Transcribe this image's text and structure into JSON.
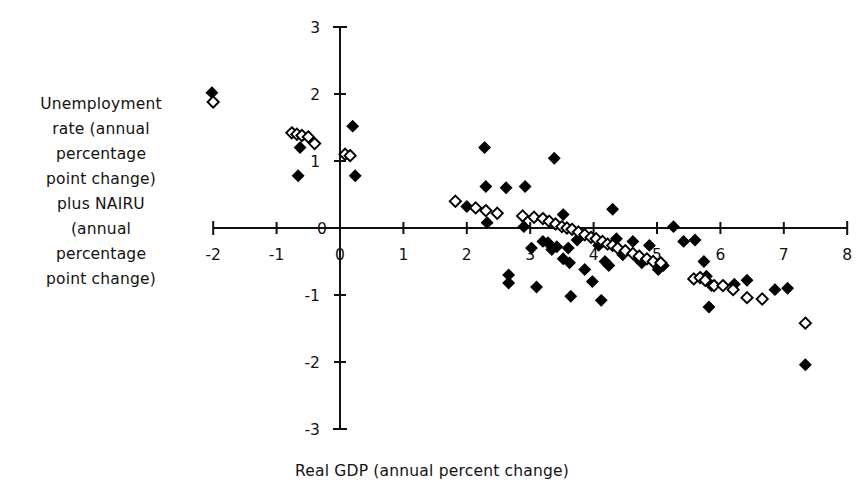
{
  "chart_data": {
    "type": "scatter",
    "title": "",
    "xlabel": "Real GDP (annual percent change)",
    "ylabel": "Unemployment\nrate (annual\npercentage\npoint change)\nplus NAIRU\n(annual\npercentage\npoint change)",
    "xlim": [
      -2,
      8
    ],
    "ylim": [
      -3,
      3
    ],
    "xticks": [
      -2,
      -1,
      0,
      1,
      2,
      3,
      4,
      5,
      6,
      7,
      8
    ],
    "xtick_labels": [
      "-2",
      "-1",
      "0",
      "1",
      "2",
      "3",
      "4",
      "5",
      "6",
      "7",
      "8"
    ],
    "yticks": [
      -3,
      -2,
      -1,
      0,
      1,
      2,
      3
    ],
    "ytick_labels": [
      "-3",
      "-2",
      "-1",
      "0",
      "1",
      "2",
      "3"
    ],
    "grid": false,
    "legend": "none",
    "axis_style": "crossed-spines-at-origin",
    "series": [
      {
        "name": "filled",
        "marker": "filled-diamond",
        "color": "#000000",
        "points": [
          [
            -2.02,
            2.02
          ],
          [
            -0.63,
            1.2
          ],
          [
            -0.66,
            0.78
          ],
          [
            0.2,
            1.52
          ],
          [
            0.24,
            0.78
          ],
          [
            2.28,
            1.2
          ],
          [
            2.3,
            0.62
          ],
          [
            2.32,
            0.08
          ],
          [
            2.62,
            0.6
          ],
          [
            2.0,
            0.32
          ],
          [
            2.66,
            -0.7
          ],
          [
            2.66,
            -0.82
          ],
          [
            2.92,
            0.62
          ],
          [
            2.9,
            0.02
          ],
          [
            3.02,
            -0.3
          ],
          [
            3.2,
            -0.2
          ],
          [
            3.28,
            -0.22
          ],
          [
            3.34,
            -0.32
          ],
          [
            3.42,
            -0.28
          ],
          [
            3.1,
            -0.88
          ],
          [
            3.52,
            -0.46
          ],
          [
            3.6,
            -0.3
          ],
          [
            3.62,
            -0.52
          ],
          [
            3.38,
            1.04
          ],
          [
            3.52,
            0.2
          ],
          [
            3.74,
            -0.18
          ],
          [
            3.86,
            -0.62
          ],
          [
            3.64,
            -1.02
          ],
          [
            3.98,
            -0.8
          ],
          [
            4.08,
            -0.26
          ],
          [
            4.18,
            -0.5
          ],
          [
            4.24,
            -0.56
          ],
          [
            4.3,
            0.28
          ],
          [
            4.36,
            -0.16
          ],
          [
            4.46,
            -0.4
          ],
          [
            4.12,
            -1.08
          ],
          [
            4.62,
            -0.2
          ],
          [
            4.7,
            -0.46
          ],
          [
            4.76,
            -0.52
          ],
          [
            4.88,
            -0.26
          ],
          [
            5.02,
            -0.62
          ],
          [
            5.1,
            -0.56
          ],
          [
            5.26,
            0.02
          ],
          [
            5.42,
            -0.2
          ],
          [
            5.6,
            -0.18
          ],
          [
            5.74,
            -0.5
          ],
          [
            5.78,
            -0.72
          ],
          [
            5.86,
            -0.86
          ],
          [
            5.82,
            -1.18
          ],
          [
            6.22,
            -0.84
          ],
          [
            6.42,
            -0.78
          ],
          [
            6.86,
            -0.92
          ],
          [
            7.06,
            -0.9
          ],
          [
            7.34,
            -2.04
          ]
        ]
      },
      {
        "name": "open",
        "marker": "open-diamond",
        "color": "#000000",
        "points": [
          [
            -2.0,
            1.88
          ],
          [
            -0.76,
            1.42
          ],
          [
            -0.68,
            1.4
          ],
          [
            -0.6,
            1.38
          ],
          [
            -0.5,
            1.36
          ],
          [
            -0.4,
            1.26
          ],
          [
            0.08,
            1.1
          ],
          [
            0.16,
            1.08
          ],
          [
            1.82,
            0.4
          ],
          [
            2.14,
            0.3
          ],
          [
            2.3,
            0.26
          ],
          [
            2.48,
            0.22
          ],
          [
            2.88,
            0.18
          ],
          [
            3.06,
            0.16
          ],
          [
            3.2,
            0.14
          ],
          [
            3.3,
            0.1
          ],
          [
            3.4,
            0.06
          ],
          [
            3.5,
            0.02
          ],
          [
            3.58,
            0.0
          ],
          [
            3.66,
            -0.02
          ],
          [
            3.76,
            -0.06
          ],
          [
            3.86,
            -0.1
          ],
          [
            3.96,
            -0.14
          ],
          [
            4.04,
            -0.16
          ],
          [
            4.14,
            -0.2
          ],
          [
            4.22,
            -0.24
          ],
          [
            4.3,
            -0.26
          ],
          [
            4.38,
            -0.3
          ],
          [
            4.5,
            -0.34
          ],
          [
            4.62,
            -0.38
          ],
          [
            4.72,
            -0.42
          ],
          [
            4.84,
            -0.46
          ],
          [
            4.94,
            -0.5
          ],
          [
            5.06,
            -0.52
          ],
          [
            5.58,
            -0.76
          ],
          [
            5.68,
            -0.74
          ],
          [
            5.76,
            -0.78
          ],
          [
            5.9,
            -0.86
          ],
          [
            6.04,
            -0.86
          ],
          [
            6.2,
            -0.92
          ],
          [
            6.42,
            -1.04
          ],
          [
            6.66,
            -1.06
          ],
          [
            7.34,
            -1.42
          ]
        ]
      }
    ]
  }
}
